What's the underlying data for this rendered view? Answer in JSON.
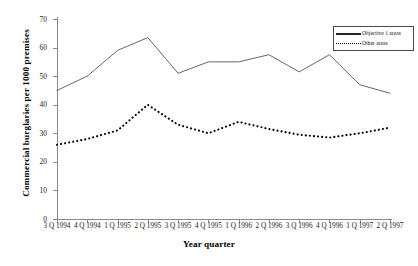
{
  "chart_data": {
    "type": "line",
    "title": "",
    "xlabel": "Year quarter",
    "ylabel": "Commercial burglaries per 1000 premises",
    "categories": [
      "3 Q 1994",
      "4 Q 1994",
      "1 Q 1995",
      "2 Q 1995",
      "3 Q 1995",
      "4 Q 1995",
      "1 Q 1996",
      "2 Q 1996",
      "3 Q 1996",
      "4 Q 1996",
      "1 Q 1997",
      "2 Q 1997"
    ],
    "series": [
      {
        "name": "Objective 1 areas",
        "style": "solid",
        "values": [
          45,
          50,
          59,
          63.5,
          51,
          55,
          55,
          57.5,
          51.5,
          57.5,
          47,
          44
        ]
      },
      {
        "name": "Other areas",
        "style": "dotted",
        "values": [
          26,
          28,
          31,
          40,
          33,
          30,
          34,
          31.5,
          29.5,
          28.5,
          30,
          32
        ]
      }
    ],
    "ylim": [
      0,
      70
    ],
    "yticks": [
      0,
      10,
      20,
      30,
      40,
      50,
      60,
      70
    ],
    "grid": false,
    "legend_position": "top-right",
    "colors": {
      "objective1": "#555555",
      "other": "#000000",
      "axis": "#8a8a8a"
    }
  },
  "legend": {
    "items": [
      {
        "label": "Objective 1 areas"
      },
      {
        "label": "Other areas"
      }
    ]
  }
}
